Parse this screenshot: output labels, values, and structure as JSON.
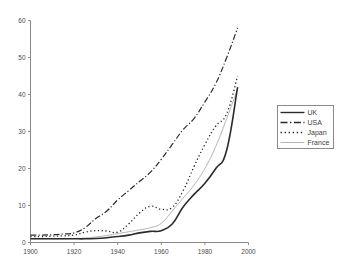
{
  "chart_data": {
    "type": "line",
    "title": "",
    "subtitle": "",
    "xlabel": "",
    "ylabel": "",
    "xlim": [
      1900,
      2000
    ],
    "ylim": [
      0,
      60
    ],
    "grid": false,
    "legend_position": "right",
    "x_ticks": [
      "1900",
      "1920",
      "1940",
      "1960",
      "1980",
      "2000"
    ],
    "x_tick_values": [
      1900,
      1920,
      1940,
      1960,
      1980,
      2000
    ],
    "y_ticks": [
      "0",
      "10",
      "20",
      "30",
      "40",
      "50",
      "60"
    ],
    "y_tick_values": [
      0,
      10,
      20,
      30,
      40,
      50,
      60
    ],
    "x": [
      1900,
      1905,
      1910,
      1915,
      1920,
      1925,
      1930,
      1935,
      1940,
      1945,
      1950,
      1955,
      1960,
      1965,
      1970,
      1975,
      1980,
      1985,
      1990,
      1995
    ],
    "series": [
      {
        "name": "UK",
        "style": "solid",
        "color": "#2b2b2b",
        "width": 1.6,
        "values": [
          1.0,
          1.0,
          1.0,
          1.0,
          1.0,
          1.0,
          1.1,
          1.3,
          1.6,
          2.0,
          2.6,
          3.0,
          3.2,
          5.0,
          9.6,
          13.0,
          16.0,
          20.0,
          25.0,
          42.0
        ]
      },
      {
        "name": "USA",
        "style": "dashdot",
        "color": "#2b2b2b",
        "width": 1.2,
        "values": [
          2.0,
          2.0,
          2.1,
          2.3,
          2.6,
          4.0,
          6.5,
          8.5,
          11.5,
          14.0,
          16.5,
          19.0,
          22.5,
          26.5,
          30.5,
          33.5,
          38.0,
          43.0,
          50.0,
          58.0
        ]
      },
      {
        "name": "Japan",
        "style": "dotted",
        "color": "#2b2b2b",
        "width": 1.3,
        "values": [
          1.6,
          1.6,
          1.7,
          1.8,
          2.0,
          2.8,
          3.2,
          3.1,
          2.8,
          5.0,
          8.0,
          9.8,
          9.0,
          9.5,
          14.0,
          20.5,
          26.5,
          31.5,
          34.8,
          45.0
        ]
      },
      {
        "name": "France",
        "style": "solid",
        "color": "#b4b4b4",
        "width": 1.0,
        "values": [
          1.0,
          1.0,
          1.0,
          1.0,
          1.1,
          1.2,
          1.5,
          1.9,
          2.4,
          2.9,
          3.4,
          4.0,
          5.2,
          8.5,
          12.0,
          15.5,
          20.0,
          26.0,
          33.5,
          41.5
        ]
      }
    ],
    "legend_entries": [
      {
        "label": "UK",
        "style": "solid",
        "color": "#2b2b2b"
      },
      {
        "label": "USA",
        "style": "dashdot",
        "color": "#2b2b2b"
      },
      {
        "label": "Japan",
        "style": "dotted",
        "color": "#2b2b2b"
      },
      {
        "label": "France",
        "style": "solid",
        "color": "#b4b4b4"
      }
    ]
  }
}
